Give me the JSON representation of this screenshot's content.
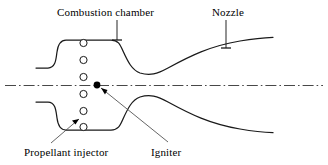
{
  "figure": {
    "background_color": "#ffffff",
    "line_color": "#1a1a1a",
    "centerline_color": "#333333",
    "width": 328,
    "height": 165
  },
  "labels": {
    "combustion_chamber": "Combustion chamber",
    "nozzle": "Nozzle",
    "propellant_injector": "Propellant injector",
    "igniter": "Igniter"
  },
  "diagram": {
    "centerline_y": 85,
    "injector_holes": {
      "count": 6,
      "cx": 83.5,
      "r": 3.6,
      "cy_values": [
        43,
        60,
        77,
        94,
        111,
        127
      ]
    },
    "igniter_point": {
      "x": 97,
      "y": 85,
      "r": 3.4
    },
    "upper_wall_path": "M 36 68 L 48 68 C 56 68 56 58 57 52 C 58 44 61 40 66 40 L 111 40 C 118 40 120 44 123 51 C 128 62 132 70 140 73 C 150 76 157 74 168 68 C 190 56 210 46 240 41 C 255 38.5 266 37.6 273 37.3",
    "lower_wall_path": "M 36 102 L 48 102 C 56 102 56 112 57 118 C 58 126 61 130 66 130 L 111 130 C 118 130 120 126 123 119 C 128 108 132 100 140 97 C 150 94 157 96 168 102 C 190 114 210 124 240 129 C 255 131.5 266 132.4 273 132.7",
    "centerline_path": "M 5 85.5 L 323 85.5",
    "pointers": [
      {
        "name": "combustion-chamber-pointer",
        "path": "M 117 20 L 117 40",
        "tick": "M 112 40 L 122 40"
      },
      {
        "name": "nozzle-pointer",
        "path": "M 226 20 L 226 48",
        "tick": "M 221 48 L 231 48"
      }
    ],
    "leaders": [
      {
        "name": "propellant-injector-leader",
        "path": "M 51 143 L 79 119",
        "arrow": "M 79 119 L 72 120.5 L 75.5 124.5 Z"
      },
      {
        "name": "igniter-leader",
        "path": "M 168 142 L 101 88",
        "arrow": "M 101 88 L 107.5 90 L 105 94.5 Z"
      }
    ]
  }
}
